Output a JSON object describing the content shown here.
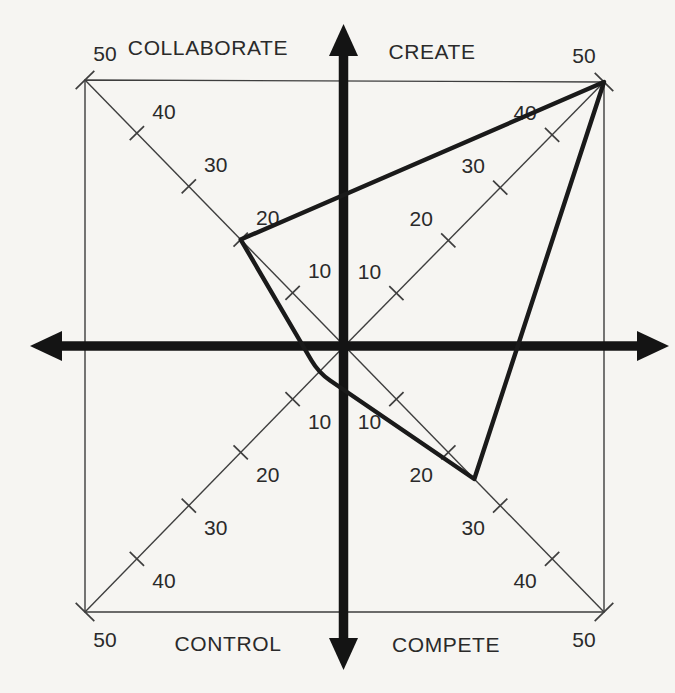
{
  "chart_data": {
    "type": "radar",
    "quadrants": [
      {
        "name": "COLLABORATE",
        "position": "top-left",
        "value": 20
      },
      {
        "name": "CREATE",
        "position": "top-right",
        "value": 50
      },
      {
        "name": "COMPETE",
        "position": "bottom-right",
        "value": 25
      },
      {
        "name": "CONTROL",
        "position": "bottom-left",
        "value": 5
      }
    ],
    "axis": {
      "ticks": [
        10,
        20,
        30,
        40,
        50
      ],
      "min": 0,
      "max": 50,
      "corner_label": "50"
    },
    "legend": "none",
    "grid": "diagonal scales with perpendicular tick slashes, square frame, bold crosshair axes with arrowheads",
    "colors": {
      "thin_line": "#3e3e3e",
      "bold_line": "#141414",
      "profile_line": "#1a1a1a",
      "text": "#2a2a2a",
      "background": "#f6f5f2"
    }
  }
}
